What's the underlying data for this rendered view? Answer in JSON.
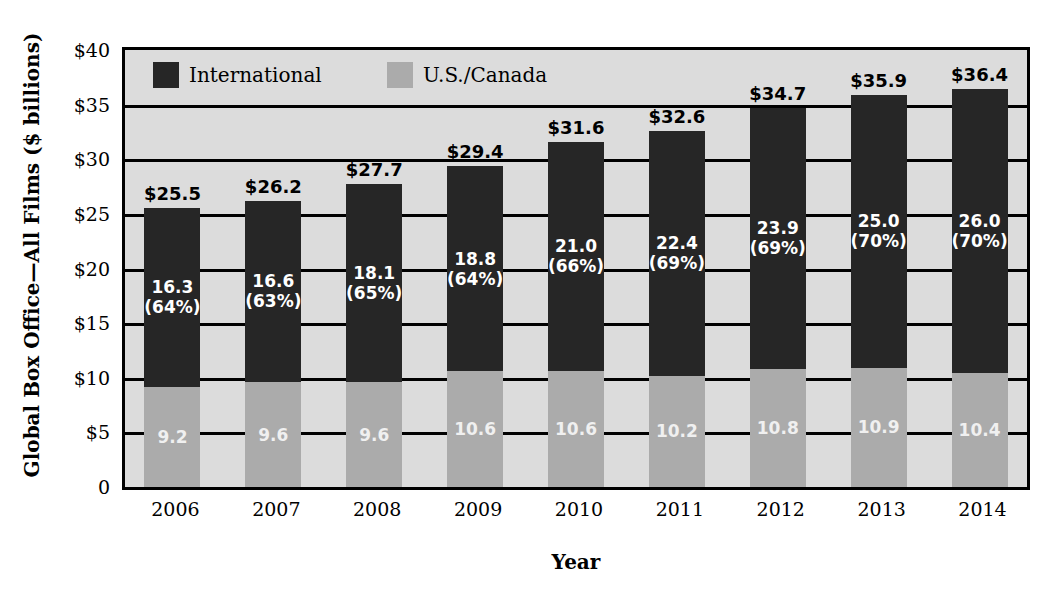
{
  "chart_data": {
    "type": "bar",
    "subtype": "stacked-bar",
    "title": "",
    "xlabel": "Year",
    "ylabel": "Global Box Office—All Films ($ billions)",
    "categories": [
      "2006",
      "2007",
      "2008",
      "2009",
      "2010",
      "2011",
      "2012",
      "2013",
      "2014"
    ],
    "ylim": [
      0,
      40
    ],
    "yticks": [
      0,
      5,
      10,
      15,
      20,
      25,
      30,
      35,
      40
    ],
    "ytick_labels": [
      "0",
      "$5",
      "$10",
      "$15",
      "$20",
      "$25",
      "$30",
      "$35",
      "$40"
    ],
    "grid": true,
    "legend_position": "inside-top-left",
    "series": [
      {
        "name": "U.S./Canada",
        "color": "#ababab",
        "values": [
          9.2,
          9.6,
          9.6,
          10.6,
          10.6,
          10.2,
          10.8,
          10.9,
          10.4
        ],
        "labels": [
          "9.2",
          "9.6",
          "9.6",
          "10.6",
          "10.6",
          "10.2",
          "10.8",
          "10.9",
          "10.4"
        ]
      },
      {
        "name": "International",
        "color": "#262626",
        "values": [
          16.3,
          16.6,
          18.1,
          18.8,
          21.0,
          22.4,
          23.9,
          25.0,
          26.0
        ],
        "labels": [
          "16.3",
          "16.6",
          "18.1",
          "18.8",
          "21.0",
          "22.4",
          "23.9",
          "25.0",
          "26.0"
        ],
        "pct_labels": [
          "(64%)",
          "(63%)",
          "(65%)",
          "(64%)",
          "(66%)",
          "(69%)",
          "(69%)",
          "(70%)",
          "(70%)"
        ]
      }
    ],
    "totals": [
      25.5,
      26.2,
      27.7,
      29.4,
      31.6,
      32.6,
      34.7,
      35.9,
      36.4
    ],
    "total_labels": [
      "$25.5",
      "$26.2",
      "$27.7",
      "$29.4",
      "$31.6",
      "$32.6",
      "$34.7",
      "$35.9",
      "$36.4"
    ]
  },
  "legend": {
    "items": [
      {
        "label": "International",
        "color": "#262626"
      },
      {
        "label": "U.S./Canada",
        "color": "#ababab"
      }
    ]
  },
  "colors": {
    "international": "#262626",
    "us_canada": "#ababab",
    "plot_background": "#dcdcdc",
    "axis": "#000000",
    "page_background": "#ffffff"
  }
}
